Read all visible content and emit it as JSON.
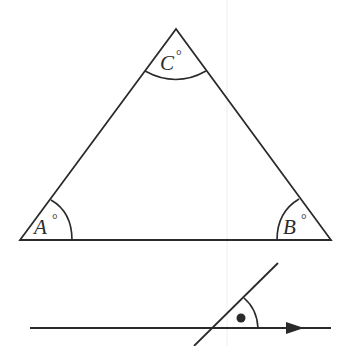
{
  "diagram": {
    "triangle": {
      "vertices": {
        "top": [
          176,
          29
        ],
        "bottom_left": [
          20,
          240
        ],
        "bottom_right": [
          331,
          240
        ]
      },
      "angles": [
        {
          "id": "A",
          "label": "A",
          "degree_symbol": "°"
        },
        {
          "id": "B",
          "label": "B",
          "degree_symbol": "°"
        },
        {
          "id": "C",
          "label": "C",
          "degree_symbol": "°"
        }
      ]
    },
    "transversal_figure": {
      "horizontal_line": {
        "from": [
          30,
          328
        ],
        "to": [
          331,
          328
        ],
        "arrow_at_x": 300
      },
      "diagonal_line": {
        "from": [
          194,
          346
        ],
        "to": [
          278,
          263
        ]
      },
      "angle_marker": "filled-dot"
    },
    "colors": {
      "stroke": "#2a2a2a",
      "background": "#ffffff"
    }
  }
}
